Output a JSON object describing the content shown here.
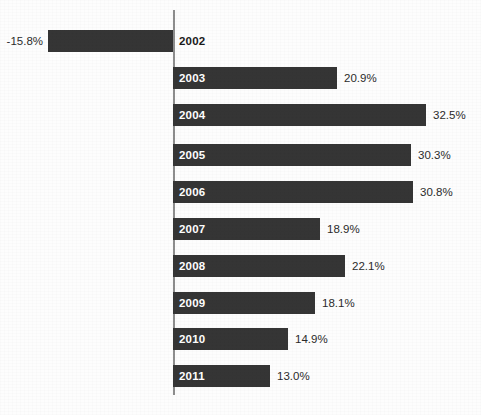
{
  "chart_data": {
    "type": "bar",
    "orientation": "horizontal",
    "title": "",
    "subtitle": "",
    "xlabel": "",
    "ylabel": "",
    "categories": [
      "2002",
      "2003",
      "2004",
      "2005",
      "2006",
      "2007",
      "2008",
      "2009",
      "2010",
      "2011"
    ],
    "values": [
      -15.8,
      20.9,
      32.5,
      30.3,
      30.8,
      18.9,
      22.1,
      18.1,
      14.9,
      13.0
    ],
    "value_labels": [
      "-15.8%",
      "20.9%",
      "32.5%",
      "30.3%",
      "30.8%",
      "18.9%",
      "22.1%",
      "18.1%",
      "14.9%",
      "13.0%"
    ],
    "unit": "%",
    "xlim": [
      -15.8,
      32.5
    ],
    "grid": false,
    "legend": null,
    "axis": {
      "zero_line": true,
      "tick_labels": [],
      "axis_label": ""
    },
    "series": [
      {
        "name": "",
        "values": [
          -15.8,
          20.9,
          32.5,
          30.3,
          30.8,
          18.9,
          22.1,
          18.1,
          14.9,
          13.0
        ]
      }
    ],
    "colors": {
      "bar": "#353535",
      "axis": "#8d8d8d",
      "background": "#fdfdfd",
      "label_inside": "#ffffff",
      "label_outside": "#1a1a1a",
      "value_label": "#2b2b2b"
    },
    "bars": [
      {
        "category": "2002",
        "value": -15.8,
        "value_label": "-15.8%",
        "label_position": "outside-right-of-axis",
        "value_label_side": "left",
        "bar_left": 48,
        "bar_width": 125,
        "row_top": 30
      },
      {
        "category": "2003",
        "value": 20.9,
        "value_label": "20.9%",
        "label_position": "inside",
        "value_label_side": "right",
        "bar_left": 173,
        "bar_width": 164,
        "row_top": 67
      },
      {
        "category": "2004",
        "value": 32.5,
        "value_label": "32.5%",
        "label_position": "inside",
        "value_label_side": "right",
        "bar_left": 173,
        "bar_width": 253,
        "row_top": 104
      },
      {
        "category": "2005",
        "value": 30.3,
        "value_label": "30.3%",
        "label_position": "inside",
        "value_label_side": "right",
        "bar_left": 173,
        "bar_width": 238,
        "row_top": 144
      },
      {
        "category": "2006",
        "value": 30.8,
        "value_label": "30.8%",
        "label_position": "inside",
        "value_label_side": "right",
        "bar_left": 173,
        "bar_width": 240,
        "row_top": 181
      },
      {
        "category": "2007",
        "value": 18.9,
        "value_label": "18.9%",
        "label_position": "inside",
        "value_label_side": "right",
        "bar_left": 173,
        "bar_width": 147,
        "row_top": 218
      },
      {
        "category": "2008",
        "value": 22.1,
        "value_label": "22.1%",
        "label_position": "inside",
        "value_label_side": "right",
        "bar_left": 173,
        "bar_width": 172,
        "row_top": 255
      },
      {
        "category": "2009",
        "value": 18.1,
        "value_label": "18.1%",
        "label_position": "inside",
        "value_label_side": "right",
        "bar_left": 173,
        "bar_width": 142,
        "row_top": 292
      },
      {
        "category": "2010",
        "value": 14.9,
        "value_label": "14.9%",
        "label_position": "inside",
        "value_label_side": "right",
        "bar_left": 173,
        "bar_width": 115,
        "row_top": 328
      },
      {
        "category": "2011",
        "value": 13.0,
        "value_label": "13.0%",
        "label_position": "inside",
        "value_label_side": "right",
        "bar_left": 173,
        "bar_width": 97,
        "row_top": 365
      }
    ]
  }
}
